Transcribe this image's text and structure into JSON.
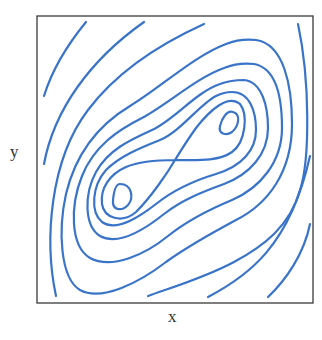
{
  "chart_data": {
    "type": "contour",
    "title": "",
    "xlabel": "x",
    "ylabel": "y",
    "ticks": {
      "x": [],
      "y": []
    },
    "grid": false,
    "legend": null,
    "line_color": "#3a74c8",
    "frame": {
      "x": 37,
      "y": 16,
      "width": 276,
      "height": 287
    },
    "critical_points": [
      {
        "type": "center",
        "position": "lower-left",
        "approx_px": [
          120,
          197
        ]
      },
      {
        "type": "center",
        "position": "upper-right",
        "approx_px": [
          229,
          124
        ]
      },
      {
        "type": "saddle",
        "position": "center",
        "approx_px": [
          175,
          160
        ]
      }
    ],
    "contours": [
      {
        "id": "small-loop-left",
        "closed": true,
        "d": "M 120 184 C 132 184, 134 198, 128 205 C 121 212, 112 210, 113 200 C 114 190, 116 184, 120 184 Z"
      },
      {
        "id": "small-loop-right",
        "closed": true,
        "d": "M 233 112 C 241 114, 239 126, 232 132 C 226 136, 218 134, 220 126 C 222 118, 227 110, 233 112 Z"
      },
      {
        "id": "separatrix",
        "closed": true,
        "d": "M 175 160 C 195 160, 218 162, 232 152 C 246 142, 248 114, 240 104 C 228 94, 210 110, 196 128 C 186 142, 180 152, 175 160 C 168 172, 152 196, 136 212 C 122 224, 104 218, 102 204 C 100 188, 110 174, 126 167 C 140 161, 158 160, 175 160 Z"
      },
      {
        "id": "orbit-1",
        "closed": true,
        "d": "M 232 92 C 250 92, 256 112, 256 130 C 256 150, 242 166, 216 174 C 196 180, 176 188, 156 204 C 138 218, 116 232, 102 222 C 90 212, 92 186, 106 170 C 120 156, 140 148, 160 140 C 180 132, 200 104, 216 96 C 222 93, 227 92, 232 92 Z"
      },
      {
        "id": "orbit-2",
        "closed": true,
        "d": "M 244 80 C 262 82, 268 106, 268 128 C 268 154, 250 174, 224 184 C 202 192, 182 200, 164 214 C 144 230, 118 246, 100 236 C 84 226, 84 194, 96 172 C 108 150, 130 140, 152 130 C 174 120, 196 92, 220 84 C 228 81, 236 80, 244 80 Z"
      },
      {
        "id": "orbit-3",
        "closed": true,
        "d": "M 254 64 C 276 68, 282 98, 282 128 C 282 162, 260 188, 232 200 C 208 210, 188 220, 168 236 C 146 254, 112 270, 90 258 C 70 246, 70 206, 82 176 C 94 146, 118 130, 142 118 C 168 104, 196 78, 224 68 C 234 64, 244 63, 254 64 Z"
      },
      {
        "id": "orbit-4",
        "closed": true,
        "d": "M 256 40 C 284 44, 292 86, 292 124 C 292 172, 268 204, 236 220 C 210 234, 188 246, 166 262 C 140 282, 102 302, 80 290 C 60 278, 58 230, 66 194 C 76 152, 100 124, 130 106 C 160 88, 194 56, 226 44 C 236 40, 246 39, 256 40 Z"
      },
      {
        "id": "open-top-left-1",
        "closed": false,
        "d": "M 44 96 C 52 70, 68 44, 86 22"
      },
      {
        "id": "open-top-left-2",
        "closed": false,
        "d": "M 44 164 C 54 110, 90 60, 144 22"
      },
      {
        "id": "open-top-left-3",
        "closed": false,
        "d": "M 56 296 C 44 240, 50 160, 88 110 C 118 70, 160 44, 204 24"
      },
      {
        "id": "open-right-1",
        "closed": false,
        "d": "M 298 24 C 310 80, 310 160, 300 190 C 290 226, 264 246, 234 262 C 204 278, 170 288, 148 296"
      },
      {
        "id": "open-bottom-right-1",
        "closed": false,
        "d": "M 208 297 C 248 276, 290 246, 310 156"
      },
      {
        "id": "open-bottom-right-2",
        "closed": false,
        "d": "M 268 297 C 286 280, 304 254, 310 224"
      }
    ]
  }
}
